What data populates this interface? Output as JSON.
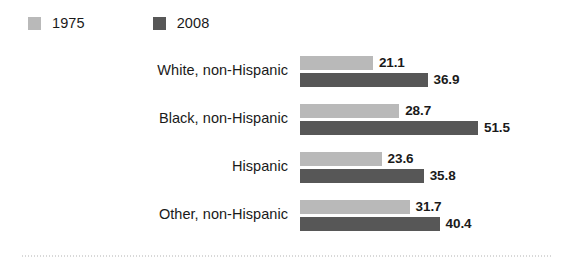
{
  "chart_data": {
    "type": "bar",
    "orientation": "horizontal",
    "title": "",
    "subtitle": "",
    "xlabel": "",
    "ylabel": "",
    "grid": false,
    "legend_position": "top-left",
    "xlim": [
      0,
      51.5
    ],
    "categories": [
      "White, non-Hispanic",
      "Black, non-Hispanic",
      "Hispanic",
      "Other, non-Hispanic"
    ],
    "series": [
      {
        "name": "1975",
        "color": "#b9b9b9",
        "values": [
          21.1,
          28.7,
          23.6,
          31.7
        ],
        "labels": [
          "21.1",
          "28.7",
          "23.6",
          "31.7"
        ]
      },
      {
        "name": "2008",
        "color": "#575757",
        "values": [
          36.9,
          51.5,
          35.8,
          40.4
        ],
        "labels": [
          "36.9",
          "51.5",
          "35.8",
          "40.4"
        ]
      }
    ]
  },
  "legend": {
    "entries": [
      {
        "label": "1975",
        "swatch_color": "#b9b9b9"
      },
      {
        "label": "2008",
        "swatch_color": "#575757"
      }
    ]
  },
  "footer": {
    "rule_color": "#d8d8d8"
  }
}
